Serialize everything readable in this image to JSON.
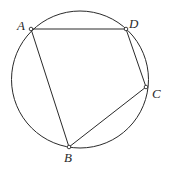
{
  "diagram": {
    "type": "cyclic-quadrilateral",
    "circle": {
      "cx": 80,
      "cy": 79.5,
      "r": 68.5
    },
    "points": [
      {
        "id": "A",
        "label": "A",
        "x": 31,
        "y": 29,
        "lx": 17,
        "ly": 30
      },
      {
        "id": "D",
        "label": "D",
        "x": 126,
        "y": 29,
        "lx": 129,
        "ly": 28
      },
      {
        "id": "C",
        "label": "C",
        "x": 146,
        "y": 87,
        "lx": 152,
        "ly": 98
      },
      {
        "id": "B",
        "label": "B",
        "x": 69,
        "y": 147,
        "lx": 64,
        "ly": 162
      }
    ],
    "segments": [
      [
        "A",
        "D"
      ],
      [
        "D",
        "C"
      ],
      [
        "C",
        "B"
      ],
      [
        "B",
        "A"
      ]
    ],
    "colors": {
      "stroke": "#2a2a2a",
      "point_fill": "#ffffff"
    }
  }
}
